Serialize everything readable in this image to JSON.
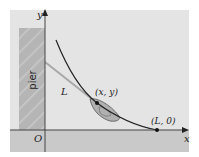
{
  "diagram": {
    "pier_label": "pier",
    "axis_labels": {
      "x": "x",
      "y": "y",
      "origin": "O"
    },
    "rope_label": "L",
    "boat_point_label": "(x, y)",
    "end_point_label": "(L, 0)",
    "colors": {
      "panel": "#e4e4e4",
      "ground": "#c9c9c9",
      "pier": "#b5b5b5",
      "pier_hatch": "#c8c8c8",
      "curve": "#222222",
      "rope": "#a8a8a8",
      "boat": "#b0b0b0"
    }
  }
}
